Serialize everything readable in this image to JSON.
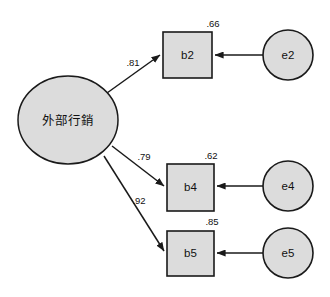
{
  "diagram": {
    "type": "sem-path-diagram",
    "title": "",
    "background_color": "#ffffff",
    "node_fill_color": "#dcdcdc",
    "stroke_color": "#1a1a1a"
  },
  "latent": {
    "id": "latent-1",
    "label": "外部行銷",
    "shape": "ellipse",
    "cx": 68,
    "cy": 120,
    "rx": 50,
    "ry": 44
  },
  "indicators": [
    {
      "id": "b2",
      "label": "b2",
      "shape": "rect",
      "x": 163,
      "y": 32,
      "width": 49,
      "height": 46,
      "smc": ".66",
      "smc_x": 213,
      "smc_y": 24,
      "loading": ".81",
      "loading_x": 133,
      "loading_y": 63
    },
    {
      "id": "b4",
      "label": "b4",
      "shape": "rect",
      "x": 167,
      "y": 164,
      "width": 47,
      "height": 47,
      "smc": ".62",
      "smc_x": 211,
      "smc_y": 156,
      "loading": ".79",
      "loading_x": 144,
      "loading_y": 157
    },
    {
      "id": "b5",
      "label": "b5",
      "shape": "rect",
      "x": 167,
      "y": 231,
      "width": 47,
      "height": 45,
      "smc": ".85",
      "smc_x": 212,
      "smc_y": 222,
      "loading": ".92",
      "loading_x": 139,
      "loading_y": 201
    }
  ],
  "errors": [
    {
      "id": "e2",
      "label": "e2",
      "shape": "circle",
      "cx": 288,
      "cy": 55,
      "r": 25
    },
    {
      "id": "e4",
      "label": "e4",
      "shape": "circle",
      "cx": 288,
      "cy": 186,
      "r": 25
    },
    {
      "id": "e5",
      "label": "e5",
      "shape": "circle",
      "cx": 288,
      "cy": 253,
      "r": 25
    }
  ],
  "paths": {
    "loading_arrows": [
      {
        "id": "path-latent-b2",
        "from": "latent-1",
        "to": "b2",
        "coefficient": ".81"
      },
      {
        "id": "path-latent-b4",
        "from": "latent-1",
        "to": "b4",
        "coefficient": ".79"
      },
      {
        "id": "path-latent-b5",
        "from": "latent-1",
        "to": "b5",
        "coefficient": ".92"
      }
    ],
    "error_arrows": [
      {
        "id": "path-e2-b2",
        "from": "e2",
        "to": "b2"
      },
      {
        "id": "path-e4-b4",
        "from": "e4",
        "to": "b4"
      },
      {
        "id": "path-e5-b5",
        "from": "e5",
        "to": "b5"
      }
    ]
  }
}
